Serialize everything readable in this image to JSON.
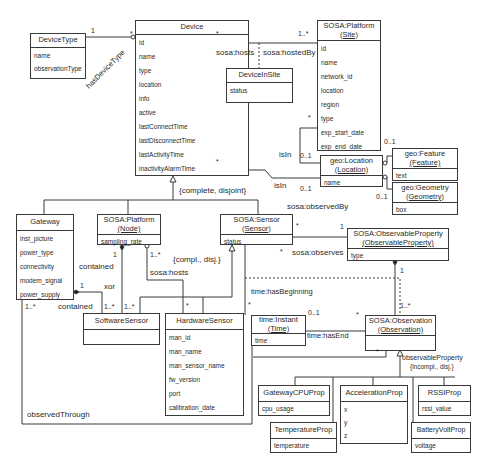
{
  "classes": {
    "device_type": {
      "name": "DeviceType",
      "attrs": [
        "name",
        "observationType"
      ]
    },
    "device": {
      "name": "Device",
      "attrs": [
        "id",
        "name",
        "type",
        "location",
        "info",
        "active",
        "lastConnectTime",
        "lastDisconnectTime",
        "lastActivityTime",
        "inactivityAlarmTime"
      ]
    },
    "device_in_site": {
      "name": "DeviceInSite",
      "attrs": [
        "status"
      ]
    },
    "platform_site": {
      "name": "SOSA:Platform",
      "sub": "(Site)",
      "attrs": [
        "id",
        "name",
        "network_id",
        "location",
        "region",
        "type",
        "exp_start_date",
        "exp_end_date"
      ]
    },
    "geo_location": {
      "name": "geo:Location",
      "sub": "(Location)",
      "attrs": [
        "name"
      ]
    },
    "geo_feature": {
      "name": "geo:Feature",
      "sub": "(Feature)",
      "attrs": [
        "text"
      ]
    },
    "geo_geometry": {
      "name": "geo:Geometry",
      "sub": "(Geometry)",
      "attrs": [
        "box"
      ]
    },
    "gateway": {
      "name": "Gateway",
      "attrs": [
        "inst_picture",
        "power_type",
        "connectivity",
        "modem_signal",
        "power_supply"
      ]
    },
    "platform_node": {
      "name": "SOSA:Platform",
      "sub": "(Node)",
      "attrs": [
        "sampling_rate"
      ]
    },
    "sensor": {
      "name": "SOSA:Sensor",
      "sub": "(Sensor)",
      "attrs": [
        "status"
      ]
    },
    "observable_property": {
      "name": "SOSA:ObservableProperty",
      "sub": "(ObservableProperty)",
      "attrs": [
        "type"
      ]
    },
    "software_sensor": {
      "name": "SoftwareSensor",
      "attrs": []
    },
    "hardware_sensor": {
      "name": "HardwareSensor",
      "attrs": [
        "man_id",
        "man_name",
        "man_sensor_name",
        "fw_version",
        "port",
        "calibration_date"
      ]
    },
    "time_instant": {
      "name": "time:Instant",
      "sub": "(Time)",
      "attrs": [
        "time"
      ]
    },
    "observation": {
      "name": "SOSA:Observation",
      "sub": "(Observation)",
      "attrs": []
    },
    "gateway_cpu_prop": {
      "name": "GatewayCPUProp",
      "attrs": [
        "cpu_usage"
      ]
    },
    "temperature_prop": {
      "name": "TemperatureProp",
      "attrs": [
        "temperature"
      ]
    },
    "acceleration_prop": {
      "name": "AccelerationProp",
      "attrs": [
        "x",
        "y",
        "z"
      ]
    },
    "rssi_prop": {
      "name": "RSSIProp",
      "attrs": [
        "rssi_value"
      ]
    },
    "battery_volt_prop": {
      "name": "BatteryVoltProp",
      "attrs": [
        "voltage"
      ]
    }
  },
  "labels": {
    "has_device_type": "hasDeviceType",
    "sosa_hosts_top": "sosa:hosts",
    "sosa_hosted_by": "sosa:hostedBy",
    "is_in_site": "isIn",
    "is_in_device": "isIn",
    "complete_disjoint": "{complete, disjoint}",
    "sosa_observed_by": "sosa:observedBy",
    "sosa_observes": "sosa:observes",
    "contained_node": "contained",
    "contained_gateway": "contained",
    "xor": "xor",
    "sosa_hosts_node": "sosa:hosts",
    "compl_disj": "{compl., disj.}",
    "time_has_beginning": "time:hasBeginning",
    "time_has_end": "time:hasEnd",
    "observable_property_rel": "observableProperty",
    "incompl_disj": "{incompl., disj.}",
    "observed_through": "observedThrough"
  },
  "multiplicities": {
    "devtype_one": "1",
    "devtype_many": "*",
    "device_hosts_many": "*",
    "site_hosts_many": "1..*",
    "site_loc_many": "*",
    "site_loc_opt": "0..1",
    "device_loc_many": "*",
    "device_loc_opt": "0..1",
    "feature_opt": "0..1",
    "geometry_opt": "0..1",
    "sensor_observed_many": "*",
    "obsprop_one": "1",
    "sensor_observes_many": "*",
    "obsprop_obs_one": "1",
    "obs_obsprop_many": "1..*",
    "node_contained_one": "1",
    "node_hosts_many": "1..*",
    "gateway_contained_one": "1",
    "gateway_obs_many": "1..*",
    "sw_contained_many": "1..*",
    "sw_node_many": "1..*",
    "hw_hosts_many": "*",
    "time_begin_many": "*",
    "time_end_opt": "0..1",
    "obs_time_many": "*",
    "obs_sensor_many": "*"
  }
}
